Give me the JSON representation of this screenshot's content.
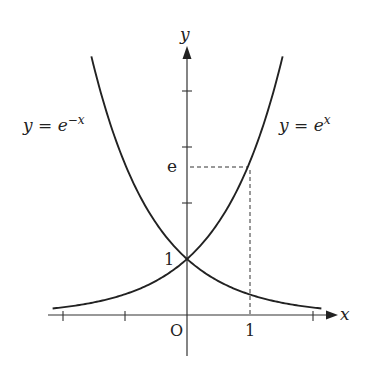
{
  "chart_data": {
    "type": "line",
    "title": "",
    "xlabel": "x",
    "ylabel": "y",
    "origin_label": "O",
    "series": [
      {
        "name": "y = e^x",
        "label_text": "y = e",
        "label_sup": "x",
        "x": [
          -2.15,
          -2,
          -1.5,
          -1,
          -0.5,
          0,
          0.5,
          1,
          1.25,
          1.5,
          1.53
        ],
        "values": [
          0.116,
          0.135,
          0.223,
          0.368,
          0.607,
          1.0,
          1.649,
          2.718,
          3.49,
          4.48,
          4.62
        ]
      },
      {
        "name": "y = e^-x",
        "label_text": "y = e",
        "label_sup": "−x",
        "x": [
          -1.53,
          -1.5,
          -1.25,
          -1,
          -0.5,
          0,
          0.5,
          1,
          1.5,
          2,
          2.15
        ],
        "values": [
          4.62,
          4.48,
          3.49,
          2.718,
          1.649,
          1.0,
          0.607,
          0.368,
          0.223,
          0.135,
          0.116
        ]
      }
    ],
    "annotations": [
      {
        "type": "point",
        "x": 0,
        "y": 1,
        "label": "1"
      },
      {
        "type": "dashed-guide",
        "x": 1,
        "y": 2.718,
        "x_label": "1",
        "y_label": "e"
      }
    ],
    "x_ticks": [
      -2,
      -1,
      1,
      2
    ],
    "y_ticks": [
      1,
      2,
      3,
      4
    ],
    "tick_labels": {
      "x": [
        "1"
      ],
      "y": [
        "1",
        "e"
      ]
    },
    "xlim": [
      -2.2,
      2.4
    ],
    "ylim": [
      -0.7,
      4.9
    ],
    "grid": false,
    "legend": "inline labels"
  },
  "labels": {
    "y_axis": "y",
    "x_axis": "x",
    "origin": "O",
    "y_one": "1",
    "x_one": "1",
    "e_mark": "e",
    "left_curve_base": "y = e",
    "left_curve_sup": "−x",
    "right_curve_base": "y = e",
    "right_curve_sup": "x"
  },
  "colors": {
    "ink": "#222222",
    "background": "#ffffff"
  }
}
